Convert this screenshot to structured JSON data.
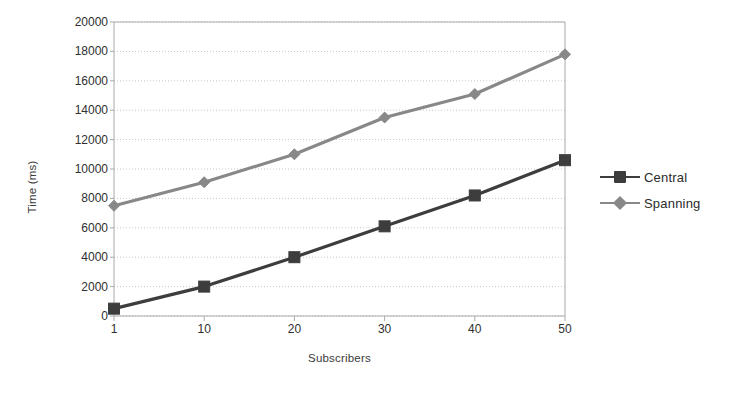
{
  "chart_data": {
    "type": "line",
    "title": "",
    "subtitle": "",
    "xlabel": "Subscribers",
    "ylabel": "Time (ms)",
    "x": [
      1,
      10,
      20,
      30,
      40,
      50
    ],
    "xtick_labels": [
      "1",
      "10",
      "20",
      "30",
      "40",
      "50"
    ],
    "ytick_labels": [
      "0",
      "2000",
      "4000",
      "6000",
      "8000",
      "10000",
      "12000",
      "14000",
      "16000",
      "18000",
      "20000"
    ],
    "ytick_values": [
      0,
      2000,
      4000,
      6000,
      8000,
      10000,
      12000,
      14000,
      16000,
      18000,
      20000
    ],
    "ylim": [
      0,
      20000
    ],
    "grid": "horizontal",
    "legend_position": "right",
    "series": [
      {
        "name": "Central",
        "color": "#3d3d3d",
        "marker": "square",
        "values": [
          500,
          2000,
          4000,
          6100,
          8200,
          10600
        ]
      },
      {
        "name": "Spanning",
        "color": "#888888",
        "marker": "diamond",
        "values": [
          7500,
          9100,
          11000,
          13500,
          15100,
          17800
        ]
      }
    ]
  },
  "legend": {
    "entries": [
      {
        "label": "Central"
      },
      {
        "label": "Spanning"
      }
    ]
  },
  "axes": {
    "y_axis_title": "Time (ms)",
    "x_axis_title": "Subscribers"
  },
  "style": {
    "plot_border": "#aaaaaa",
    "gridline": "#c8c8c8",
    "background": "#ffffff"
  }
}
